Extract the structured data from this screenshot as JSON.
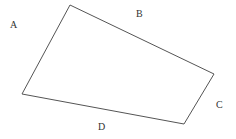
{
  "diagram": {
    "type": "quadrilateral",
    "stroke_color": "#555555",
    "fill_color": "#ffffff",
    "vertices": [
      {
        "x": 70,
        "y": 5
      },
      {
        "x": 214,
        "y": 74
      },
      {
        "x": 184,
        "y": 124
      },
      {
        "x": 22,
        "y": 94
      }
    ],
    "labels": [
      {
        "text": "A",
        "x": 10,
        "y": 28
      },
      {
        "text": "B",
        "x": 136,
        "y": 17
      },
      {
        "text": "C",
        "x": 216,
        "y": 108
      },
      {
        "text": "D",
        "x": 98,
        "y": 130
      }
    ]
  }
}
